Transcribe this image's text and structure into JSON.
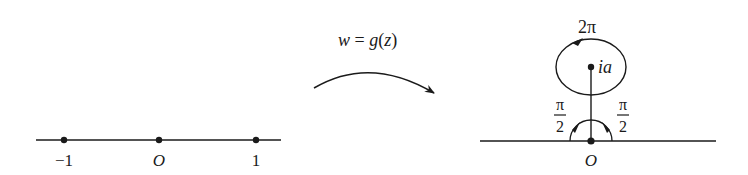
{
  "left_plane": {
    "points": [
      {
        "x": 64,
        "label": "−1"
      },
      {
        "x": 159,
        "label": "O"
      },
      {
        "x": 256,
        "label": "1"
      }
    ],
    "axis": {
      "x1": 36,
      "x2": 281,
      "y": 140
    }
  },
  "mapping": {
    "label": "w = g(z)",
    "label_parts": [
      "w",
      " = ",
      "g",
      "(",
      "z",
      ")"
    ]
  },
  "right_plane": {
    "axis": {
      "x1": 480,
      "x2": 716,
      "y": 141
    },
    "origin_label": "O",
    "center_label": "ia",
    "loop_angle_label": "2π",
    "left_angle": {
      "num": "π",
      "den": "2"
    },
    "right_angle": {
      "num": "π",
      "den": "2"
    }
  },
  "colors": {
    "ink": "#1a1a1a",
    "background": "#ffffff"
  }
}
